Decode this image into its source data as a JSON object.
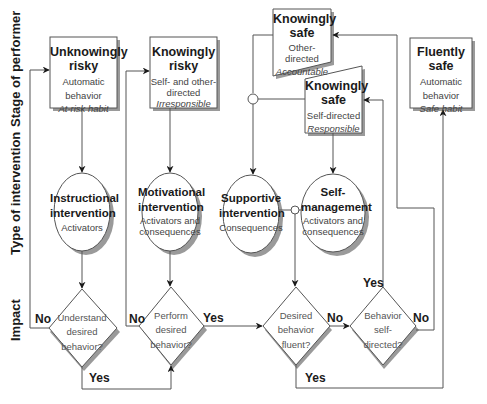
{
  "axes": {
    "stage": "Stage of performer",
    "intervention": "Type of intervention",
    "impact": "Impact"
  },
  "stages": [
    {
      "title1": "Unknowingly",
      "title2": "risky",
      "line1": "Automatic",
      "line2": "behavior",
      "italic": "At-risk habit"
    },
    {
      "title1": "Knowingly",
      "title2": "risky",
      "line1": "Self- and other-",
      "line2": "directed",
      "italic": "Irresponsible"
    },
    {
      "title1": "Knowingly",
      "title2": "safe",
      "line1": "Other-directed",
      "italic": "Accountable"
    },
    {
      "title1": "Knowingly",
      "title2": "safe",
      "line1": "Self-directed",
      "italic": "Responsible"
    },
    {
      "title1": "Fluently",
      "title2": "safe",
      "line1": "Automatic",
      "line2": "behavior",
      "italic": "Safe habit"
    }
  ],
  "interventions": [
    {
      "title1": "Instructional",
      "title2": "intervention",
      "line1": "Activators"
    },
    {
      "title1": "Motivational",
      "title2": "intervention",
      "line1": "Activators and",
      "line2": "consequences"
    },
    {
      "title1": "Supportive",
      "title2": "intervention",
      "line1": "Consequences"
    },
    {
      "title1": "Self-",
      "title2": "management",
      "line1": "Activators and",
      "line2": "consequences"
    }
  ],
  "decisions": [
    {
      "line1": "Understand",
      "line2": "desired",
      "line3": "behavior?"
    },
    {
      "line1": "Perform",
      "line2": "desired",
      "line3": "behavior?"
    },
    {
      "line1": "Desired",
      "line2": "behavior",
      "line3": "fluent?"
    },
    {
      "line1": "Behavior",
      "line2": "self-",
      "line3": "directed?"
    }
  ],
  "edge_labels": {
    "no": "No",
    "yes": "Yes"
  },
  "colors": {
    "line": "#555555",
    "shadow": "#9a9a9a",
    "fill": "#ffffff"
  }
}
